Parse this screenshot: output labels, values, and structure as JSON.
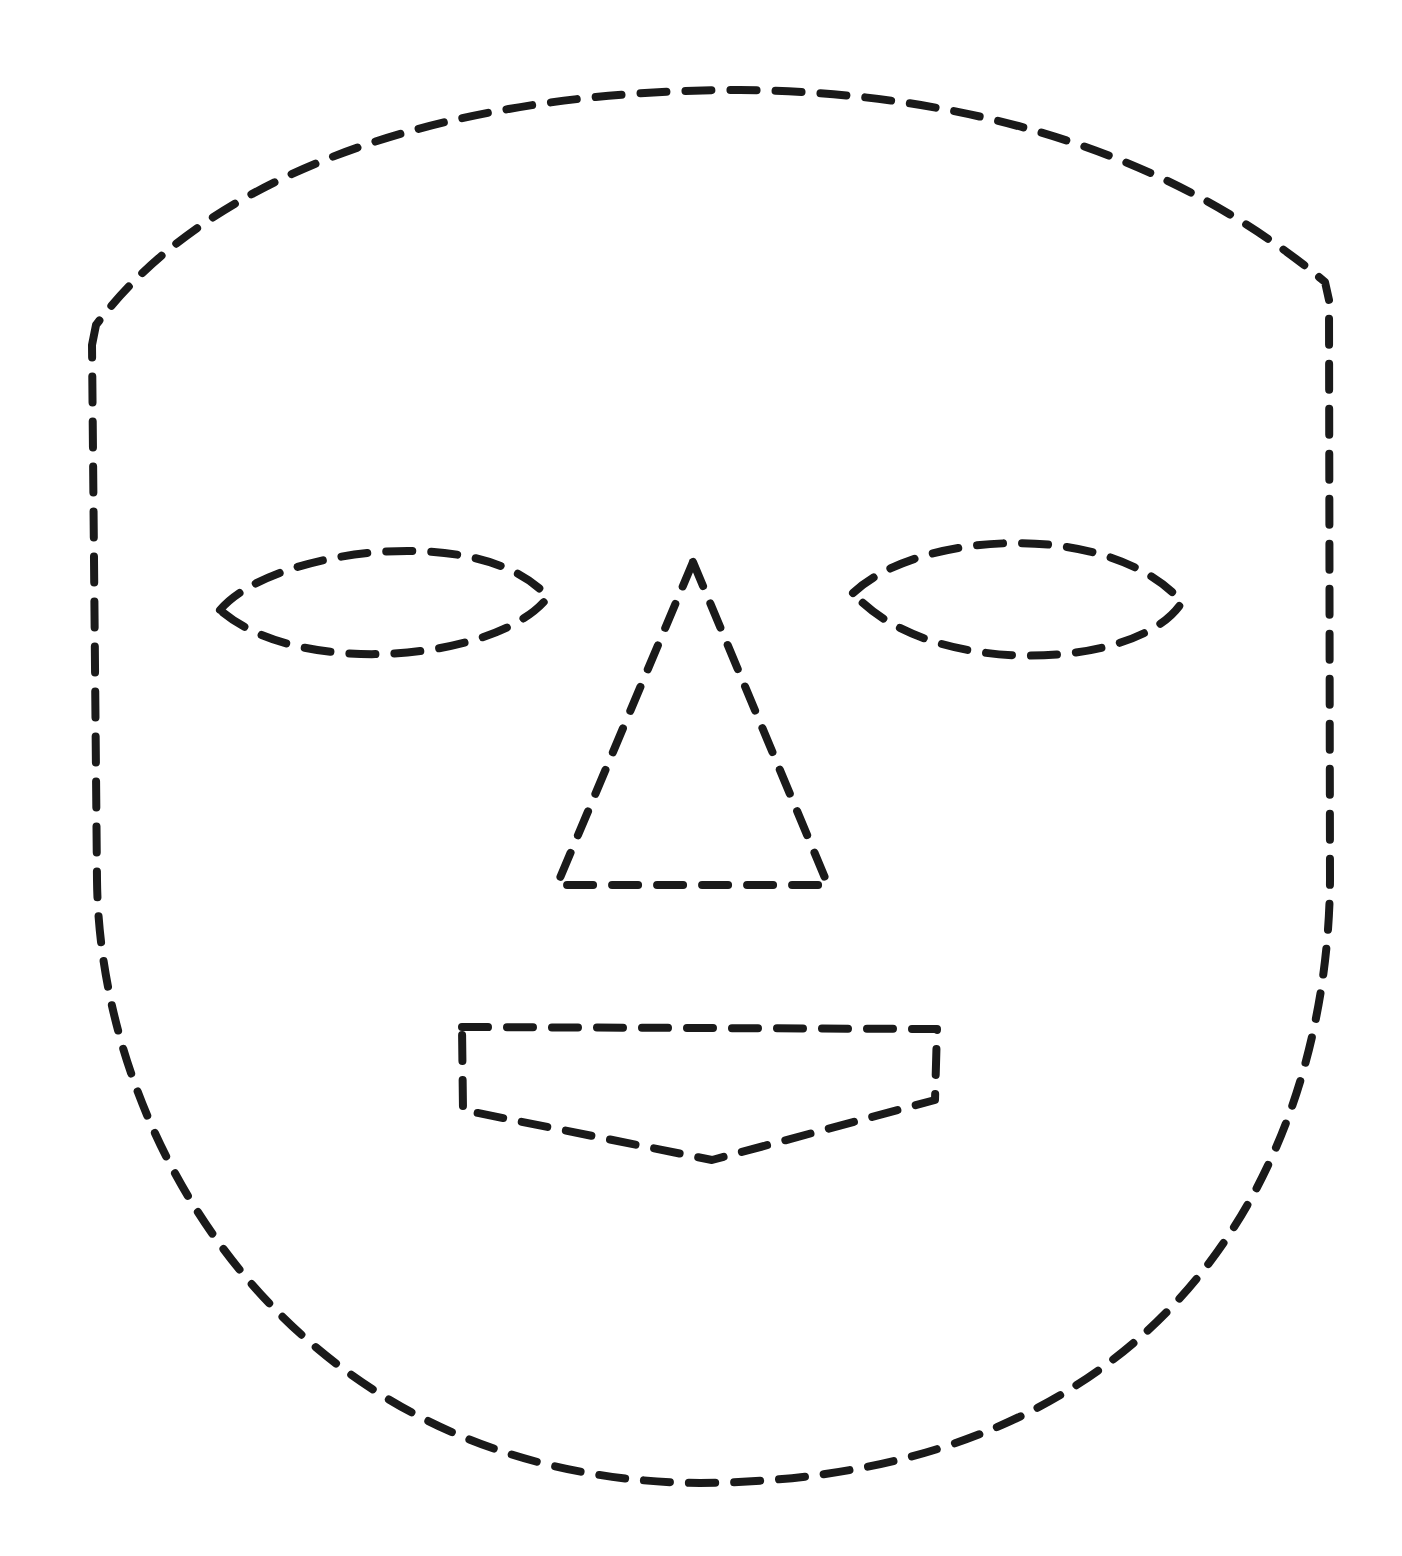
{
  "drawing": {
    "subject": "dashed-line face outline",
    "background_color": "#ffffff",
    "stroke_color": "#1a1a1a",
    "stroke_width": 8,
    "dash_pattern": "26 19",
    "features": {
      "face_outline": {
        "shape": "shield / rounded-bottom mask",
        "path": "M 92 345 L 96 325 C 220 160 470 90 740 90 C 980 92 1180 160 1325 282 L 1329 300 L 1330 880 C 1328 1150 1180 1480 700 1483 C 300 1480 100 1150 97 880 Z"
      },
      "left_eye": {
        "shape": "almond",
        "path": "M 220 610 C 270 550 480 520 548 597 C 500 660 300 680 220 610 Z"
      },
      "right_eye": {
        "shape": "almond",
        "path": "M 853 593 C 920 530 1110 520 1182 602 C 1140 670 930 680 853 593 Z"
      },
      "nose": {
        "shape": "triangle",
        "path": "M 693 562 L 828 885 L 557 885 Z"
      },
      "mouth": {
        "shape": "pentagon (flat top, pointed bottom)",
        "path": "M 462 1027 L 937 1029 L 935 1100 L 712 1160 L 463 1110 Z"
      }
    }
  }
}
